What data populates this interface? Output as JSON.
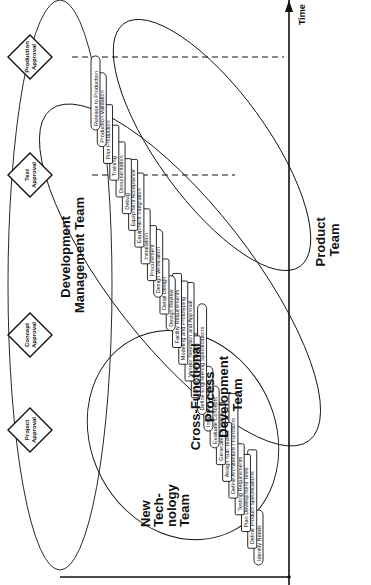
{
  "diagram": {
    "orientation": "rotated-90-ccw",
    "axis": {
      "label": "Time"
    },
    "milestones": [
      {
        "id": "project",
        "line1": "Project",
        "line2": "Approval",
        "x": 155
      },
      {
        "id": "concept",
        "line1": "Concept",
        "line2": "Approval",
        "x": 250
      },
      {
        "id": "test",
        "line1": "Test",
        "line2": "Approval",
        "x": 410
      },
      {
        "id": "production",
        "line1": "Production",
        "line2": "Approval",
        "x": 528
      }
    ],
    "teams": [
      {
        "id": "development-management",
        "line1": "Development",
        "line2": "Management Team"
      },
      {
        "id": "new-technology",
        "line1": "New",
        "line2": "Tech-",
        "line3": "nology",
        "line4": "Team"
      },
      {
        "id": "cross-functional",
        "line1": "Cross-Functional",
        "line2": "Process",
        "line3": "Development",
        "line4": "Team"
      },
      {
        "id": "product",
        "line1": "Product",
        "line2": "Team"
      }
    ],
    "tasks": [
      {
        "label": "Identify Needs",
        "shape": "oval"
      },
      {
        "label": "Define Product Specifications",
        "shape": "rect"
      },
      {
        "label": "Plan Development Tests",
        "shape": "rect"
      },
      {
        "label": "Testing Requirements",
        "shape": "rect"
      },
      {
        "label": "Define Architecture / Functions",
        "shape": "rect"
      },
      {
        "label": "Assign Sub-Teams",
        "shape": "rect"
      },
      {
        "label": "Generate Concepts",
        "shape": "rect"
      },
      {
        "label": "Evaluate Concepts",
        "shape": "oval"
      },
      {
        "label": "Integrate Concepts",
        "shape": "oval"
      },
      {
        "label": "Define Engineering Specifications",
        "shape": "oval"
      },
      {
        "label": "Embodiment Design",
        "shape": "rect"
      },
      {
        "label": "Vendor Selection and Approval",
        "shape": "rect"
      },
      {
        "label": "Modeling and Prototyping",
        "shape": "rect"
      },
      {
        "label": "Facility Requirements",
        "shape": "rect"
      },
      {
        "label": "Design Review",
        "shape": "oval"
      },
      {
        "label": "Detail Design",
        "shape": "rect"
      },
      {
        "label": "Design Verification",
        "shape": "oval"
      },
      {
        "label": "Procurement",
        "shape": "rect"
      },
      {
        "label": "Installation",
        "shape": "rect"
      },
      {
        "label": "Equipment Integration",
        "shape": "rect"
      },
      {
        "label": "Equipment Acceptance",
        "shape": "rect"
      },
      {
        "label": "Debug",
        "shape": "rect"
      },
      {
        "label": "Documentation",
        "shape": "rect"
      },
      {
        "label": "Training",
        "shape": "rect"
      },
      {
        "label": "Pilot Production",
        "shape": "rect"
      },
      {
        "label": "Production Validation",
        "shape": "oval"
      },
      {
        "label": "Release to Production",
        "shape": "oval"
      }
    ]
  }
}
